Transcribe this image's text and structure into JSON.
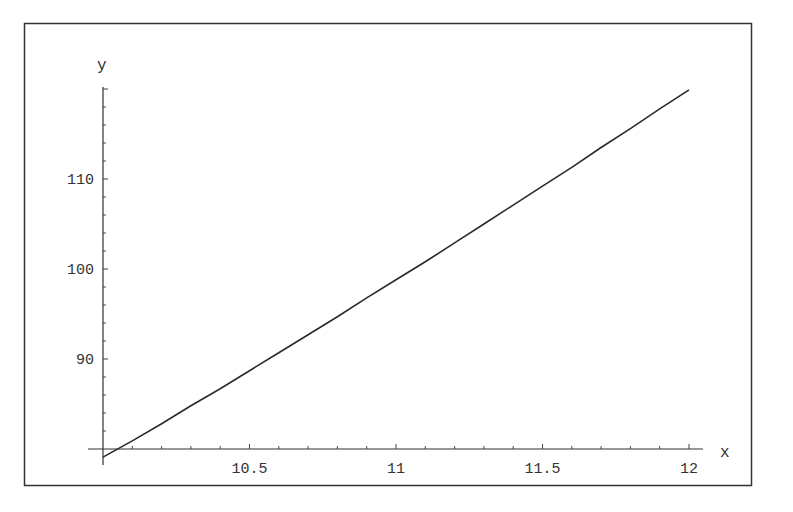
{
  "chart_data": {
    "type": "line",
    "title": "",
    "xlabel": "x",
    "ylabel": "y",
    "xlim": [
      10,
      12.05
    ],
    "ylim": [
      78.5,
      120.5
    ],
    "grid": false,
    "legend": null,
    "frame": true,
    "x_ticks": [
      {
        "value": 10.5,
        "label": "10.5"
      },
      {
        "value": 11,
        "label": "11"
      },
      {
        "value": 11.5,
        "label": "11.5"
      },
      {
        "value": 12,
        "label": "12"
      }
    ],
    "y_ticks": [
      {
        "value": 90,
        "label": "90"
      },
      {
        "value": 100,
        "label": "100"
      },
      {
        "value": 110,
        "label": "110"
      }
    ],
    "x_minor_step": 0.1,
    "y_minor_step": 2,
    "axes_origin": {
      "x": 10,
      "y": 80
    },
    "series": [
      {
        "name": "y(x)",
        "color": "#2a2a2a",
        "x": [
          10.0,
          10.1,
          10.2,
          10.3,
          10.4,
          10.5,
          10.6,
          10.7,
          10.8,
          10.9,
          11.0,
          11.1,
          11.2,
          11.3,
          11.4,
          11.5,
          11.6,
          11.7,
          11.8,
          11.9,
          12.0
        ],
        "y": [
          79.1,
          80.9,
          82.8,
          84.8,
          86.7,
          88.7,
          90.7,
          92.7,
          94.7,
          96.8,
          98.8,
          100.8,
          102.9,
          105.0,
          107.1,
          109.2,
          111.3,
          113.5,
          115.6,
          117.8,
          119.9
        ]
      }
    ]
  }
}
